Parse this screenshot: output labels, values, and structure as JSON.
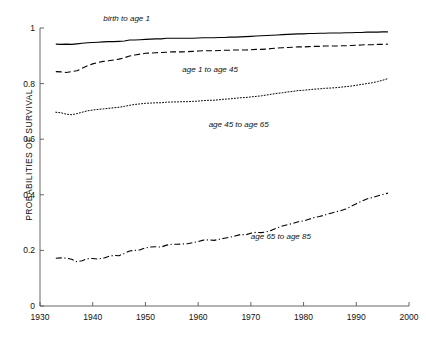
{
  "chart_data": {
    "type": "line",
    "title": "",
    "xlabel": "",
    "ylabel": "PROBABILITIES OF SURVIVAL",
    "xlim": [
      1930,
      2000
    ],
    "ylim": [
      0,
      1
    ],
    "grid": false,
    "legend_position": "inline-annotations",
    "xticks": [
      1930,
      1940,
      1950,
      1960,
      1970,
      1980,
      1990,
      2000
    ],
    "xtick_labels": [
      "1930",
      "1940",
      "1950",
      "1960",
      "1970",
      "1980",
      "1990",
      "2000"
    ],
    "yticks": [
      0,
      0.2,
      0.4,
      0.6,
      0.8,
      1
    ],
    "ytick_labels": [
      "0",
      "0.2",
      "0.4",
      "0.6",
      "0.8",
      "1"
    ],
    "x": [
      1933,
      1934,
      1935,
      1936,
      1937,
      1938,
      1939,
      1940,
      1941,
      1942,
      1943,
      1944,
      1945,
      1946,
      1947,
      1948,
      1949,
      1950,
      1951,
      1952,
      1953,
      1954,
      1955,
      1956,
      1957,
      1958,
      1959,
      1960,
      1961,
      1962,
      1963,
      1964,
      1965,
      1966,
      1967,
      1968,
      1969,
      1970,
      1971,
      1972,
      1973,
      1974,
      1975,
      1976,
      1977,
      1978,
      1979,
      1980,
      1981,
      1982,
      1983,
      1984,
      1985,
      1986,
      1987,
      1988,
      1989,
      1990,
      1991,
      1992,
      1993,
      1994,
      1995,
      1996
    ],
    "series": [
      {
        "name": "birth to age 1",
        "style": "solid",
        "color": "#000000",
        "label_x": 1942,
        "label_y": 1.03,
        "values": [
          0.942,
          0.941,
          0.942,
          0.941,
          0.943,
          0.945,
          0.947,
          0.948,
          0.949,
          0.95,
          0.951,
          0.951,
          0.952,
          0.953,
          0.957,
          0.957,
          0.958,
          0.959,
          0.96,
          0.961,
          0.961,
          0.963,
          0.963,
          0.963,
          0.963,
          0.963,
          0.963,
          0.964,
          0.965,
          0.965,
          0.965,
          0.966,
          0.966,
          0.967,
          0.967,
          0.968,
          0.969,
          0.97,
          0.971,
          0.972,
          0.973,
          0.974,
          0.975,
          0.976,
          0.977,
          0.978,
          0.979,
          0.979,
          0.98,
          0.98,
          0.981,
          0.981,
          0.982,
          0.982,
          0.982,
          0.983,
          0.983,
          0.984,
          0.984,
          0.985,
          0.985,
          0.985,
          0.986,
          0.986
        ]
      },
      {
        "name": "age 1 to age 45",
        "style": "dashed",
        "color": "#000000",
        "label_x": 1957,
        "label_y": 0.845,
        "values": [
          0.843,
          0.842,
          0.84,
          0.843,
          0.846,
          0.855,
          0.864,
          0.871,
          0.876,
          0.88,
          0.882,
          0.885,
          0.888,
          0.893,
          0.899,
          0.903,
          0.906,
          0.909,
          0.91,
          0.911,
          0.912,
          0.913,
          0.914,
          0.914,
          0.914,
          0.915,
          0.916,
          0.917,
          0.918,
          0.918,
          0.918,
          0.919,
          0.92,
          0.92,
          0.921,
          0.921,
          0.921,
          0.922,
          0.923,
          0.923,
          0.924,
          0.926,
          0.928,
          0.929,
          0.93,
          0.931,
          0.932,
          0.932,
          0.933,
          0.934,
          0.934,
          0.935,
          0.935,
          0.935,
          0.936,
          0.936,
          0.937,
          0.938,
          0.939,
          0.94,
          0.94,
          0.941,
          0.941,
          0.942
        ]
      },
      {
        "name": "age 45 to age 65",
        "style": "dotted",
        "color": "#000000",
        "label_x": 1962,
        "label_y": 0.648,
        "values": [
          0.697,
          0.695,
          0.69,
          0.688,
          0.692,
          0.697,
          0.702,
          0.705,
          0.707,
          0.709,
          0.711,
          0.713,
          0.715,
          0.718,
          0.722,
          0.725,
          0.727,
          0.729,
          0.73,
          0.731,
          0.731,
          0.733,
          0.734,
          0.734,
          0.735,
          0.735,
          0.736,
          0.737,
          0.739,
          0.74,
          0.74,
          0.742,
          0.744,
          0.745,
          0.747,
          0.749,
          0.75,
          0.752,
          0.754,
          0.756,
          0.759,
          0.762,
          0.765,
          0.767,
          0.77,
          0.772,
          0.775,
          0.776,
          0.778,
          0.78,
          0.781,
          0.783,
          0.784,
          0.785,
          0.787,
          0.789,
          0.791,
          0.794,
          0.797,
          0.8,
          0.803,
          0.807,
          0.812,
          0.818
        ]
      },
      {
        "name": "age 65 to age 85",
        "style": "dashdot",
        "color": "#000000",
        "label_x": 1970,
        "label_y": 0.245,
        "values": [
          0.172,
          0.173,
          0.172,
          0.168,
          0.159,
          0.163,
          0.17,
          0.171,
          0.169,
          0.172,
          0.178,
          0.182,
          0.181,
          0.189,
          0.198,
          0.2,
          0.202,
          0.209,
          0.212,
          0.213,
          0.212,
          0.219,
          0.222,
          0.222,
          0.223,
          0.224,
          0.228,
          0.232,
          0.237,
          0.238,
          0.236,
          0.24,
          0.244,
          0.247,
          0.252,
          0.257,
          0.256,
          0.262,
          0.265,
          0.264,
          0.267,
          0.273,
          0.281,
          0.288,
          0.293,
          0.297,
          0.303,
          0.306,
          0.312,
          0.318,
          0.322,
          0.327,
          0.333,
          0.338,
          0.343,
          0.349,
          0.358,
          0.368,
          0.377,
          0.385,
          0.39,
          0.396,
          0.401,
          0.406
        ]
      }
    ]
  }
}
